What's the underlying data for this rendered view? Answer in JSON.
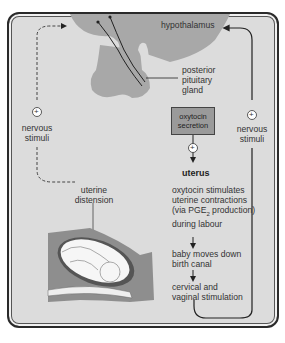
{
  "diagram": {
    "labels": {
      "hypothalamus": "hypothalamus",
      "posterior_pituitary": [
        "posterior",
        "pituitary",
        "gland"
      ],
      "oxytocin_secretion": [
        "oxytocin",
        "secretion"
      ],
      "nervous_stimuli_left": [
        "nervous",
        "stimuli"
      ],
      "nervous_stimuli_right": [
        "nervous",
        "stimuli"
      ],
      "uterus": "uterus",
      "uterine_distension": [
        "uterine",
        "distension"
      ],
      "oxytocin_effect": [
        "oxytocin stimulates",
        "uterine contractions",
        "(via PGE",
        "2",
        " production)",
        "during labour"
      ],
      "baby_moves": [
        "baby moves down",
        "birth canal"
      ],
      "cervical": [
        "cervical and",
        "vaginal stimulation"
      ]
    },
    "plus_sign": "+",
    "colors": {
      "background": "#dcdcdc",
      "organ_fill": "#a8a8a8",
      "box_fill": "#9a9a9a",
      "line": "#222222"
    }
  }
}
